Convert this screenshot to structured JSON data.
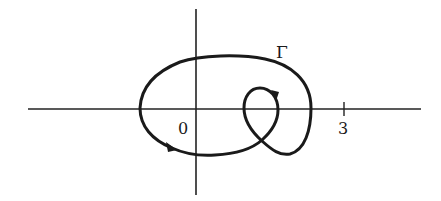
{
  "diagram": {
    "type": "contour-on-axes",
    "curve_label": "Γ",
    "origin_label": "0",
    "tick_label": "3",
    "stroke_color": "#1a1a1a",
    "background_color": "#ffffff"
  }
}
